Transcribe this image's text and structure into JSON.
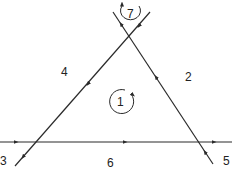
{
  "diagram": {
    "type": "signal-flow / line network with loops",
    "line_color": "#2a2a2a",
    "background": "#ffffff",
    "branches": [
      {
        "id": "2",
        "label": "2",
        "direction": "up-left along right line"
      },
      {
        "id": "3",
        "label": "3",
        "direction": "down-left toward bottom-left"
      },
      {
        "id": "4",
        "label": "4",
        "direction": "down-left along left line"
      },
      {
        "id": "5",
        "label": "5",
        "direction": "up into right line"
      },
      {
        "id": "6",
        "label": "6",
        "direction": "rightward along horizontal line"
      }
    ],
    "loops": [
      {
        "id": "1",
        "label": "1",
        "direction": "clockwise"
      },
      {
        "id": "7",
        "label": "7",
        "direction": "counterclockwise"
      }
    ]
  }
}
